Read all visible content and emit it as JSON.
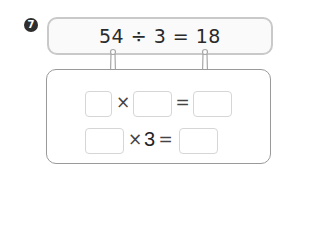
{
  "problem": {
    "number": "7",
    "equation": "54 ÷ 3 = 18"
  },
  "row1": {
    "op1": "×",
    "op2": "=",
    "cells": [
      "",
      "",
      ""
    ]
  },
  "row2": {
    "op1": "×",
    "factor": "3",
    "op2": "=",
    "cells": [
      "",
      ""
    ]
  },
  "colors": {
    "badge": "#2e2e2e",
    "top_border": "#c9c9c9",
    "bottom_border": "#9a9a9a",
    "cell_border": "#d6d6d6"
  }
}
